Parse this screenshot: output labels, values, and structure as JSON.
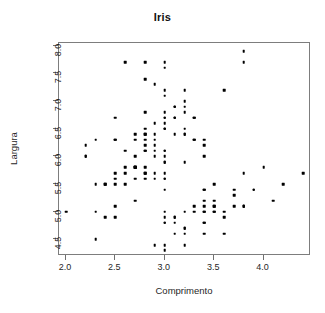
{
  "chart_data": {
    "type": "scatter",
    "title": "Iris",
    "xlabel": "Comprimento",
    "ylabel": "Largura",
    "xlim": [
      1.93,
      4.48
    ],
    "ylim": [
      4.2,
      8.05
    ],
    "grid": false,
    "legend": null,
    "marker": {
      "shape": "filled-square",
      "color": "#000000",
      "size_px": 2.6
    },
    "xticks": [
      2.0,
      2.5,
      3.0,
      3.5,
      4.0
    ],
    "xtick_labels": [
      "2.0",
      "2.5",
      "3.0",
      "3.5",
      "4.0"
    ],
    "yticks": [
      4.5,
      5.0,
      5.5,
      6.0,
      6.5,
      7.0,
      7.5,
      8.0
    ],
    "ytick_labels": [
      "4.5",
      "5.0",
      "5.5",
      "6.0",
      "6.5",
      "7.0",
      "7.5",
      "8.0"
    ],
    "n_points": 150,
    "x": [
      3.5,
      3.0,
      3.2,
      3.1,
      3.6,
      3.9,
      3.4,
      3.4,
      2.9,
      3.1,
      3.7,
      3.4,
      3.0,
      3.0,
      4.0,
      4.4,
      3.9,
      3.5,
      3.8,
      3.8,
      3.4,
      3.7,
      3.6,
      3.3,
      3.4,
      3.0,
      3.4,
      3.5,
      3.4,
      3.2,
      3.1,
      3.4,
      4.1,
      4.2,
      3.1,
      3.2,
      3.5,
      3.6,
      3.0,
      3.4,
      3.5,
      2.3,
      3.2,
      3.5,
      3.8,
      3.0,
      3.8,
      3.2,
      3.7,
      3.3,
      3.2,
      3.2,
      3.1,
      2.3,
      2.8,
      2.8,
      3.3,
      2.4,
      2.9,
      2.7,
      2.0,
      3.0,
      2.2,
      2.9,
      2.9,
      3.1,
      3.0,
      2.7,
      2.2,
      2.5,
      3.2,
      2.8,
      2.5,
      2.8,
      2.9,
      3.0,
      2.8,
      3.0,
      2.9,
      2.6,
      2.4,
      2.4,
      2.7,
      2.7,
      3.0,
      3.4,
      3.1,
      2.3,
      3.0,
      2.5,
      2.6,
      3.0,
      2.6,
      2.3,
      2.7,
      3.0,
      2.9,
      2.9,
      2.5,
      2.8,
      3.3,
      2.7,
      3.0,
      2.9,
      3.0,
      3.0,
      2.5,
      2.9,
      2.5,
      3.6,
      3.2,
      2.7,
      3.0,
      2.5,
      2.8,
      3.2,
      3.0,
      3.8,
      2.6,
      2.2,
      3.2,
      2.8,
      2.8,
      2.7,
      3.3,
      3.2,
      2.8,
      3.0,
      2.8,
      3.0,
      2.8,
      3.8,
      2.8,
      2.8,
      2.6,
      3.0,
      3.4,
      3.1,
      3.0,
      3.1,
      3.1,
      3.1,
      2.7,
      3.2,
      3.3,
      3.0,
      2.5,
      3.0,
      3.4,
      3.0
    ],
    "y": [
      5.1,
      4.9,
      4.7,
      4.6,
      5.0,
      5.4,
      4.6,
      5.0,
      4.4,
      4.9,
      5.4,
      4.8,
      4.8,
      4.3,
      5.8,
      5.7,
      5.4,
      5.1,
      5.7,
      5.1,
      5.4,
      5.1,
      4.6,
      5.1,
      4.8,
      5.0,
      5.0,
      5.2,
      5.2,
      4.7,
      4.8,
      5.4,
      5.2,
      5.5,
      4.9,
      5.0,
      5.5,
      4.9,
      4.4,
      5.1,
      5.0,
      4.5,
      4.4,
      5.0,
      5.1,
      4.8,
      5.1,
      4.6,
      5.3,
      5.0,
      7.0,
      6.4,
      6.9,
      5.5,
      6.5,
      5.7,
      6.3,
      4.9,
      6.6,
      5.2,
      5.0,
      5.9,
      6.0,
      6.1,
      5.6,
      6.7,
      5.6,
      5.8,
      6.2,
      5.6,
      5.9,
      6.1,
      6.3,
      6.1,
      6.4,
      6.6,
      6.8,
      6.7,
      6.0,
      5.7,
      5.5,
      5.5,
      5.8,
      6.0,
      5.4,
      6.0,
      6.7,
      6.3,
      5.6,
      5.5,
      5.5,
      6.1,
      5.8,
      5.0,
      5.6,
      5.7,
      5.7,
      6.2,
      5.1,
      5.7,
      6.3,
      5.8,
      7.1,
      6.3,
      6.5,
      7.6,
      4.9,
      7.3,
      6.7,
      7.2,
      6.5,
      6.4,
      6.8,
      5.7,
      5.8,
      6.4,
      6.5,
      7.7,
      7.7,
      6.0,
      6.9,
      5.6,
      7.7,
      6.3,
      6.7,
      7.2,
      6.2,
      6.1,
      6.4,
      7.2,
      7.4,
      7.9,
      6.4,
      6.3,
      6.1,
      7.7,
      6.3,
      6.4,
      6.0,
      6.9,
      6.7,
      6.9,
      5.8,
      6.8,
      6.7,
      6.7,
      6.3,
      6.5,
      6.2,
      5.9
    ]
  }
}
